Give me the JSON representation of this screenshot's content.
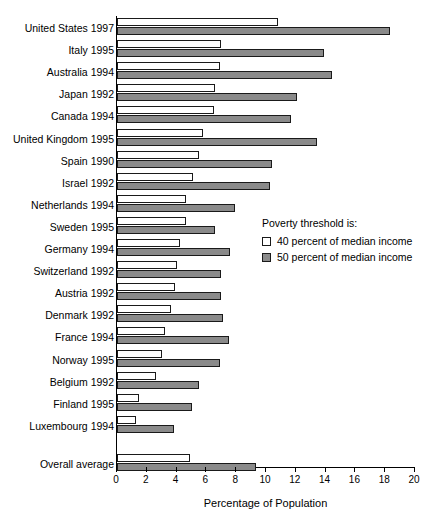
{
  "chart_data": {
    "type": "bar",
    "orientation": "horizontal",
    "title": "",
    "xlabel": "Percentage of Population",
    "ylabel": "",
    "xlim": [
      0,
      20
    ],
    "xticks": [
      0,
      2,
      4,
      6,
      8,
      10,
      12,
      14,
      16,
      18,
      20
    ],
    "grid": false,
    "legend_position": "center-right",
    "legend_title": "Poverty threshold is:",
    "categories": [
      "United States 1997",
      "Italy 1995",
      "Australia 1994",
      "Japan 1992",
      "Canada 1994",
      "United Kingdom 1995",
      "Spain 1990",
      "Israel 1992",
      "Netherlands 1994",
      "Sweden 1995",
      "Germany 1994",
      "Switzerland 1992",
      "Austria 1992",
      "Denmark 1992",
      "France 1994",
      "Norway 1995",
      "Belgium 1992",
      "Finland 1995",
      "Luxembourg 1994",
      "Overall average"
    ],
    "series": [
      {
        "name": "40 percent of median income",
        "color": "#ffffff",
        "values": [
          10.8,
          7.0,
          6.9,
          6.6,
          6.5,
          5.8,
          5.5,
          5.1,
          4.6,
          4.6,
          4.2,
          4.0,
          3.9,
          3.6,
          3.2,
          3.0,
          2.6,
          1.5,
          1.3,
          4.9
        ]
      },
      {
        "name": "50 percent of median income",
        "color": "#8a8a8a",
        "values": [
          18.3,
          13.9,
          14.4,
          12.1,
          11.7,
          13.4,
          10.4,
          10.3,
          7.9,
          6.6,
          7.6,
          7.0,
          7.0,
          7.1,
          7.5,
          6.9,
          5.5,
          5.0,
          3.8,
          9.3
        ]
      }
    ]
  },
  "axis": {
    "tick_labels": [
      "0",
      "2",
      "4",
      "6",
      "8",
      "10",
      "12",
      "14",
      "16",
      "18",
      "20"
    ],
    "title": "Percentage of Population"
  },
  "legend": {
    "title": "Poverty threshold is:",
    "items": [
      {
        "label": "40 percent of median income",
        "swatch": "white"
      },
      {
        "label": "50 percent of median income",
        "swatch": "gray"
      }
    ]
  }
}
